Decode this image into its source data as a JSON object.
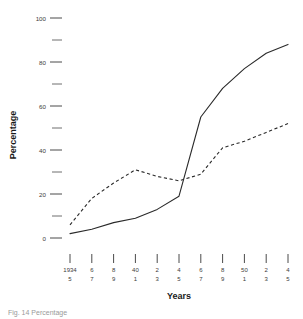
{
  "chart_data": {
    "type": "line",
    "title": "",
    "xlabel": "Years",
    "ylabel": "Percentage",
    "ylim": [
      0,
      100
    ],
    "y_ticks_major": [
      0,
      20,
      40,
      60,
      80,
      100
    ],
    "y_ticks_minor": [
      10,
      30,
      50,
      70,
      90
    ],
    "y_tick_labels": [
      "0",
      "20",
      "40",
      "60",
      "80",
      "100"
    ],
    "grid": false,
    "legend_position": "none",
    "categories": [
      "1934/5",
      "6/7",
      "8/9",
      "40/1",
      "2/3",
      "4/5",
      "6/7",
      "8/9",
      "50/1",
      "2/3",
      "4/5"
    ],
    "x_tick_labels_top": [
      "1934",
      "6",
      "8",
      "40",
      "2",
      "4",
      "6",
      "8",
      "50",
      "2",
      "4"
    ],
    "x_tick_labels_bottom": [
      "5",
      "7",
      "9",
      "1",
      "3",
      "5",
      "7",
      "9",
      "1",
      "3",
      "5"
    ],
    "series": [
      {
        "name": "solid-series",
        "style": "solid",
        "values": [
          2,
          4,
          7,
          9,
          13,
          19,
          55,
          68,
          77,
          84,
          88
        ]
      },
      {
        "name": "dashed-series",
        "style": "dashed",
        "values": [
          6,
          18,
          25,
          31,
          28,
          26,
          29,
          41,
          44,
          48,
          52
        ]
      }
    ]
  },
  "caption": {
    "text": "Fig. 14 Percentage"
  },
  "colors": {
    "line": "#2a2a2a",
    "text": "#1a1a1a",
    "tick": "#4a4a4a",
    "background": "#ffffff"
  }
}
